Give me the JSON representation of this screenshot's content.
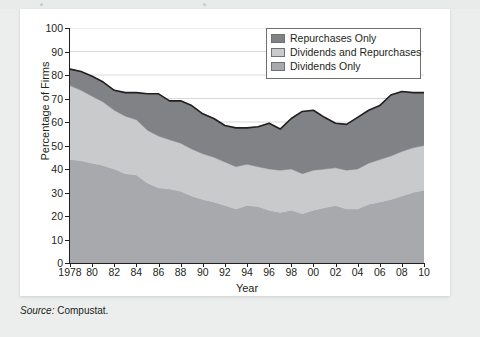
{
  "figure": {
    "source_prefix": "Source:",
    "source_value": " Compustat."
  },
  "legend": {
    "items": [
      {
        "label": "Repurchases Only",
        "color": "#808285",
        "swatch_name": "legend-swatch-repurchases-only"
      },
      {
        "label": "Dividends and Repurchases",
        "color": "#c9cacc",
        "swatch_name": "legend-swatch-dividends-and-repurchases"
      },
      {
        "label": "Dividends Only",
        "color": "#a7a9ac",
        "swatch_name": "legend-swatch-dividends-only"
      }
    ]
  },
  "chart_data": {
    "type": "area",
    "stacked": true,
    "title": "",
    "xlabel": "Year",
    "ylabel": "Percentage of Firms",
    "xlim": [
      1978,
      2010
    ],
    "ylim": [
      0,
      100
    ],
    "grid": "horizontal",
    "legend_position": "top-right",
    "x": [
      1978,
      1979,
      1980,
      1981,
      1982,
      1983,
      1984,
      1985,
      1986,
      1987,
      1988,
      1989,
      1990,
      1991,
      1992,
      1993,
      1994,
      1995,
      1996,
      1997,
      1998,
      1999,
      2000,
      2001,
      2002,
      2003,
      2004,
      2005,
      2006,
      2007,
      2008,
      2009,
      2010
    ],
    "xtick_labels": [
      "1978",
      "80",
      "82",
      "84",
      "86",
      "88",
      "90",
      "92",
      "94",
      "96",
      "98",
      "00",
      "02",
      "04",
      "06",
      "08",
      "10"
    ],
    "xtick_values": [
      1978,
      1980,
      1982,
      1984,
      1986,
      1988,
      1990,
      1992,
      1994,
      1996,
      1998,
      2000,
      2002,
      2004,
      2006,
      2008,
      2010
    ],
    "ytick_values": [
      0,
      10,
      20,
      30,
      40,
      50,
      60,
      70,
      80,
      90,
      100
    ],
    "series": [
      {
        "name": "Dividends Only",
        "color": "#a7a9ac",
        "values": [
          44.0,
          43.5,
          42.5,
          41.5,
          40.0,
          38.0,
          37.5,
          34.0,
          32.0,
          31.5,
          30.5,
          28.5,
          27.0,
          26.0,
          24.5,
          23.0,
          24.5,
          24.0,
          22.5,
          21.5,
          22.5,
          21.0,
          22.5,
          23.5,
          24.5,
          23.0,
          23.0,
          25.0,
          26.0,
          27.0,
          28.5,
          30.0,
          31.0
        ]
      },
      {
        "name": "Dividends and Repurchases",
        "color": "#c9cacc",
        "values": [
          31.5,
          30.0,
          28.5,
          27.0,
          25.0,
          24.5,
          23.5,
          22.5,
          22.0,
          21.0,
          20.5,
          20.0,
          19.5,
          19.0,
          18.5,
          18.0,
          17.5,
          17.0,
          17.5,
          18.0,
          17.5,
          17.0,
          17.0,
          16.5,
          16.0,
          16.5,
          17.0,
          17.5,
          18.0,
          18.5,
          19.0,
          19.0,
          19.0
        ]
      },
      {
        "name": "Repurchases Only",
        "color": "#808285",
        "values": [
          7.0,
          8.0,
          8.5,
          8.5,
          8.5,
          10.0,
          11.5,
          15.5,
          18.0,
          16.5,
          18.0,
          18.5,
          17.0,
          16.5,
          15.5,
          16.5,
          15.5,
          17.0,
          19.5,
          17.5,
          21.5,
          26.5,
          25.5,
          22.0,
          19.0,
          19.5,
          22.0,
          22.5,
          23.0,
          26.0,
          25.5,
          23.5,
          22.5
        ]
      }
    ],
    "totals": [
      82.5,
      81.5,
      79.5,
      77.0,
      73.5,
      72.5,
      72.5,
      72.0,
      72.0,
      69.0,
      69.0,
      67.0,
      63.5,
      61.5,
      58.5,
      57.5,
      57.5,
      58.0,
      59.5,
      57.0,
      61.5,
      64.5,
      65.0,
      62.0,
      59.5,
      59.0,
      62.0,
      65.0,
      67.0,
      71.5,
      73.0,
      72.5,
      72.5
    ]
  }
}
